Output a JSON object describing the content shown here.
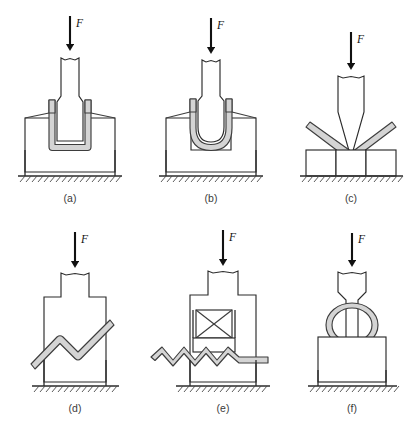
{
  "figure": {
    "background_color": "#ffffff",
    "line_color": "#2b2b2b",
    "sheet_fill_color": "#d4d4d4",
    "sheet_outline_color": "#3d3d3d",
    "force_symbol": "F",
    "panel_count": 6,
    "columns": 3,
    "rows": 2
  },
  "panels": [
    {
      "id": "a",
      "caption": "(a)",
      "force_label": "F",
      "operation": "u-die-bending-square-bottom",
      "description": "Square-bottom U bend: flat punch presses sheet into a rectangular die cavity",
      "has_ground": true,
      "has_force_arrow": true
    },
    {
      "id": "b",
      "caption": "(b)",
      "force_label": "F",
      "operation": "u-die-bending-round-bottom",
      "description": "Round-bottom U bend: round-nose punch presses sheet into a rectangular die cavity",
      "has_ground": true,
      "has_force_arrow": true
    },
    {
      "id": "c",
      "caption": "(c)",
      "force_label": "F",
      "operation": "v-die-bending",
      "description": "V bending: pointed punch bends sheet over three supporting die blocks",
      "has_ground": true,
      "has_force_arrow": true
    },
    {
      "id": "d",
      "caption": "(d)",
      "force_label": "F",
      "operation": "offset-joggle-bending",
      "description": "Offset / joggle bend: stepped punch forms a Z offset in an inclined sheet",
      "has_ground": true,
      "has_force_arrow": true
    },
    {
      "id": "e",
      "caption": "(e)",
      "force_label": "F",
      "operation": "corrugating",
      "description": "Corrugating: stepped punch with spring-loaded pressure pad forms a wavy sheet",
      "has_ground": true,
      "has_force_arrow": true,
      "pressure_pad_symbol": "crossed-box"
    },
    {
      "id": "f",
      "caption": "(f)",
      "force_label": "F",
      "operation": "tube-forming",
      "description": "Tube / ring forming: necked punch compresses a ring section on a flat base block",
      "has_ground": true,
      "has_force_arrow": true
    }
  ]
}
